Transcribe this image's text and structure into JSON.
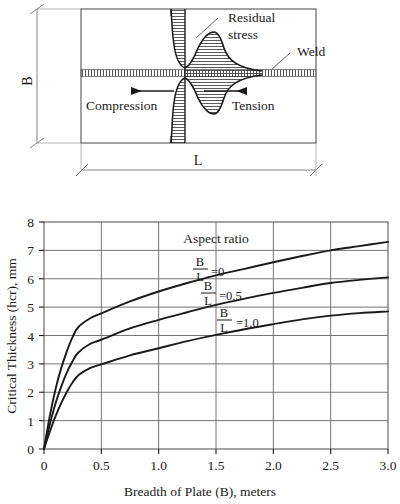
{
  "figure": {
    "diagram": {
      "title_labels": {
        "residual_stress": "Residual",
        "residual_stress_2": "stress",
        "weld": "Weld",
        "compression": "Compression",
        "tension": "Tension",
        "dim_b": "B",
        "dim_l": "L"
      },
      "colors": {
        "line": "#1a1a1a",
        "thin_line": "#555555",
        "hatch": "#333333",
        "background": "#ffffff"
      }
    }
  },
  "chart_data": {
    "type": "line",
    "title": "",
    "xlabel": "Breadth of Plate (B), meters",
    "ylabel": "Critical Thickness (hcr), mm",
    "legend_title": "Aspect ratio",
    "legend_position": "inside-upper-center",
    "grid": true,
    "xlim": [
      0,
      3.0
    ],
    "ylim": [
      0,
      8
    ],
    "xticks": [
      "0",
      "0.5",
      "1.0",
      "1.5",
      "2.0",
      "2.5",
      "3.0"
    ],
    "xtick_values": [
      0,
      0.5,
      1.0,
      1.5,
      2.0,
      2.5,
      3.0
    ],
    "yticks": [
      "0",
      "1",
      "2",
      "3",
      "4",
      "5",
      "6",
      "7",
      "8"
    ],
    "ytick_values": [
      0,
      1,
      2,
      3,
      4,
      5,
      6,
      7,
      8
    ],
    "series": [
      {
        "name": "B/L = 0",
        "numerator": "B",
        "denominator": "L",
        "value_label": "=0",
        "x": [
          0,
          0.05,
          0.1,
          0.15,
          0.2,
          0.25,
          0.3,
          0.4,
          0.5,
          0.75,
          1.0,
          1.25,
          1.5,
          1.75,
          2.0,
          2.25,
          2.5,
          2.75,
          3.0
        ],
        "values": [
          0,
          1.15,
          2.1,
          2.85,
          3.45,
          3.95,
          4.3,
          4.6,
          4.78,
          5.2,
          5.55,
          5.85,
          6.12,
          6.35,
          6.58,
          6.8,
          7.0,
          7.15,
          7.3
        ]
      },
      {
        "name": "B/L = 0.5",
        "numerator": "B",
        "denominator": "L",
        "value_label": "=0.5",
        "x": [
          0,
          0.05,
          0.1,
          0.15,
          0.2,
          0.25,
          0.3,
          0.4,
          0.5,
          0.75,
          1.0,
          1.25,
          1.5,
          1.75,
          2.0,
          2.25,
          2.5,
          2.75,
          3.0
        ],
        "values": [
          0,
          0.85,
          1.6,
          2.2,
          2.7,
          3.1,
          3.4,
          3.7,
          3.85,
          4.25,
          4.55,
          4.82,
          5.08,
          5.3,
          5.5,
          5.68,
          5.85,
          5.96,
          6.05
        ]
      },
      {
        "name": "B/L = 1.0",
        "numerator": "B",
        "denominator": "L",
        "value_label": "=1.0",
        "x": [
          0,
          0.05,
          0.1,
          0.15,
          0.2,
          0.25,
          0.3,
          0.4,
          0.5,
          0.75,
          1.0,
          1.25,
          1.5,
          1.75,
          2.0,
          2.25,
          2.5,
          2.75,
          3.0
        ],
        "values": [
          0,
          0.6,
          1.15,
          1.62,
          2.02,
          2.35,
          2.6,
          2.85,
          2.98,
          3.3,
          3.55,
          3.8,
          4.02,
          4.22,
          4.4,
          4.57,
          4.7,
          4.79,
          4.85
        ]
      }
    ]
  }
}
